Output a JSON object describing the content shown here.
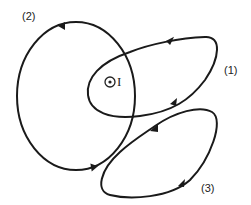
{
  "diagram": {
    "type": "ampere-loops",
    "current": {
      "symbol": "⊙",
      "label": "I",
      "direction": "out-of-page"
    },
    "loops": [
      {
        "id": "1",
        "label": "(1)",
        "encloses_current": true
      },
      {
        "id": "2",
        "label": "(2)",
        "encloses_current": true
      },
      {
        "id": "3",
        "label": "(3)",
        "encloses_current": false
      }
    ],
    "colors": {
      "stroke": "#1a1a1a",
      "background": "#ffffff"
    }
  }
}
